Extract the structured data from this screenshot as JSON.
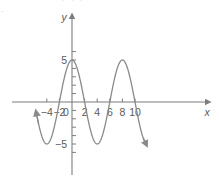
{
  "figure": {
    "clipped_header_text": "· · ·",
    "left_margin_mark": "·",
    "curve_color": "#8a8a8a",
    "axis_color": "#7d7d7d",
    "text_color": "#5a5a5a",
    "background_color": "#ffffff"
  },
  "axis_names": {
    "x": "x",
    "y": "y"
  },
  "x_labels": [
    {
      "value": -4,
      "text": "-4"
    },
    {
      "value": -2,
      "text": "-2"
    },
    {
      "value": 0,
      "text": "0"
    },
    {
      "value": 2,
      "text": "2"
    },
    {
      "value": 4,
      "text": "4"
    },
    {
      "value": 6,
      "text": "6"
    },
    {
      "value": 8,
      "text": "8"
    },
    {
      "value": 10,
      "text": "10"
    }
  ],
  "y_labels": [
    {
      "value": 5,
      "text": "5"
    },
    {
      "value": -5,
      "text": "-5"
    }
  ],
  "chart_data": {
    "type": "line",
    "title": "",
    "xlabel": "x",
    "ylabel": "y",
    "xlim": [
      -5.6,
      11.6
    ],
    "ylim": [
      -6.4,
      6.2
    ],
    "grid": false,
    "legend": null,
    "function": "y = 5 cos(pi*x/4)",
    "amplitude": 5,
    "period": 8,
    "midline": 0,
    "phase_shift": 0,
    "x_tick_interval": 1,
    "x_label_interval": 2,
    "y_tick_interval": 1,
    "y_label_interval": 5,
    "maxima": [
      {
        "x": 0,
        "y": 5
      },
      {
        "x": 8,
        "y": 5
      }
    ],
    "minima": [
      {
        "x": -4,
        "y": -5
      },
      {
        "x": 4,
        "y": -5
      }
    ],
    "zeros": [
      -2,
      2,
      6,
      10
    ],
    "arrowheads": [
      "curve-left-end",
      "curve-right-end",
      "x-axis-right",
      "y-axis-top"
    ],
    "series": [
      {
        "name": "y = 5 cos(pi*x/4)",
        "x": [
          -5.6,
          -5.4,
          -5.2,
          -5.0,
          -4.8,
          -4.6,
          -4.4,
          -4.2,
          -4.0,
          -3.8,
          -3.6,
          -3.4,
          -3.2,
          -3.0,
          -2.8,
          -2.6,
          -2.4,
          -2.2,
          -2.0,
          -1.8,
          -1.6,
          -1.4,
          -1.2,
          -1.0,
          -0.8,
          -0.6,
          -0.4,
          -0.2,
          0.0,
          0.2,
          0.4,
          0.6,
          0.8,
          1.0,
          1.2,
          1.4,
          1.6,
          1.8,
          2.0,
          2.2,
          2.4,
          2.6,
          2.8,
          3.0,
          3.2,
          3.4,
          3.6,
          3.8,
          4.0,
          4.2,
          4.4,
          4.6,
          4.8,
          5.0,
          5.2,
          5.4,
          5.6,
          5.8,
          6.0,
          6.2,
          6.4,
          6.6,
          6.8,
          7.0,
          7.2,
          7.4,
          7.6,
          7.8,
          8.0,
          8.2,
          8.4,
          8.6,
          8.8,
          9.0,
          9.2,
          9.4,
          9.6,
          9.8,
          10.0,
          10.2,
          10.4,
          10.6,
          10.8,
          11.0,
          11.2,
          11.4,
          11.6
        ],
        "y": [
          -3.54,
          -4.05,
          -4.49,
          -4.76,
          -4.94,
          -5.0,
          -4.94,
          -4.76,
          -4.49,
          -4.05,
          -3.54,
          -2.94,
          -2.25,
          -1.53,
          -0.78,
          0.0,
          0.78,
          1.53,
          2.25,
          2.94,
          3.54,
          4.05,
          4.49,
          4.76,
          4.94,
          5.0,
          4.94,
          4.76,
          5.0,
          4.94,
          4.76,
          4.49,
          4.05,
          3.54,
          2.94,
          2.25,
          1.53,
          0.78,
          0.0,
          -0.78,
          -1.53,
          -2.25,
          -2.94,
          -3.54,
          -4.05,
          -4.49,
          -4.76,
          -4.94,
          -5.0,
          -4.94,
          -4.76,
          -4.49,
          -4.05,
          -3.54,
          -2.94,
          -2.25,
          -1.53,
          -0.78,
          0.0,
          0.78,
          1.53,
          2.25,
          2.94,
          3.54,
          4.05,
          4.49,
          4.76,
          4.94,
          5.0,
          4.94,
          4.76,
          4.49,
          4.05,
          3.54,
          2.94,
          2.25,
          1.53,
          0.78,
          0.0,
          -0.78,
          -1.53,
          -2.25,
          -2.94,
          -3.54,
          -4.05,
          -4.49,
          -4.76
        ]
      }
    ]
  }
}
